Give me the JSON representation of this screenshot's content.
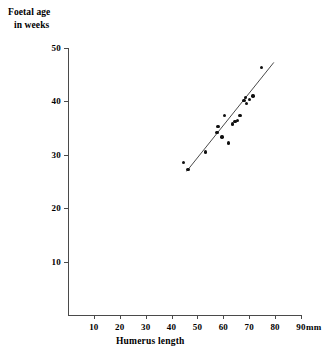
{
  "chart_data": {
    "type": "scatter",
    "title": "",
    "xlabel": "Humerus length",
    "ylabel": "Foetal age\nin weeks",
    "ylabel_lines": [
      "Foetal age",
      "in weeks"
    ],
    "x_unit": "mm",
    "xlim": [
      0,
      90
    ],
    "ylim": [
      0,
      50
    ],
    "xticks": [
      10,
      20,
      30,
      40,
      50,
      60,
      70,
      80,
      90
    ],
    "yticks": [
      10,
      20,
      30,
      40,
      50
    ],
    "grid": false,
    "legend": null,
    "marker": "filled-circle",
    "marker_color": "#101010",
    "line_color": "#4a4a4a",
    "points": [
      {
        "x": 44.5,
        "y": 28.6
      },
      {
        "x": 46.3,
        "y": 27.2
      },
      {
        "x": 53.0,
        "y": 30.5
      },
      {
        "x": 57.5,
        "y": 34.2
      },
      {
        "x": 58.0,
        "y": 35.3
      },
      {
        "x": 59.5,
        "y": 33.3
      },
      {
        "x": 60.5,
        "y": 37.4
      },
      {
        "x": 62.0,
        "y": 32.2
      },
      {
        "x": 63.5,
        "y": 35.8
      },
      {
        "x": 64.5,
        "y": 36.2
      },
      {
        "x": 65.5,
        "y": 36.4
      },
      {
        "x": 66.5,
        "y": 37.4
      },
      {
        "x": 68.0,
        "y": 40.2
      },
      {
        "x": 68.6,
        "y": 40.7
      },
      {
        "x": 69.0,
        "y": 39.6
      },
      {
        "x": 70.0,
        "y": 40.4
      },
      {
        "x": 71.5,
        "y": 41.0
      },
      {
        "x": 74.8,
        "y": 46.4
      }
    ],
    "fit_line": {
      "type": "straight-line-of-best-fit",
      "x_start": 45.8,
      "y_start": 26.9,
      "x_end": 79.5,
      "y_end": 47.3
    }
  }
}
